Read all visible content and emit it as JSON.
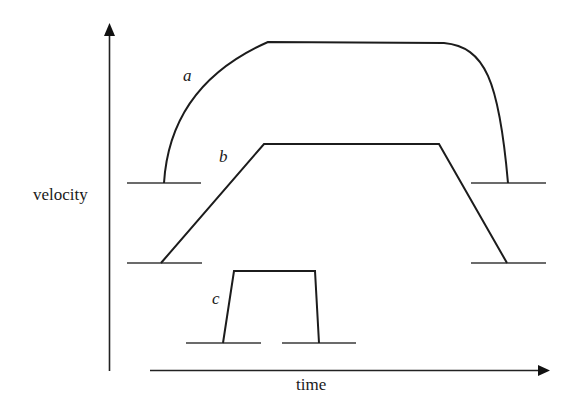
{
  "diagram": {
    "axes": {
      "y_label": "velocity",
      "x_label": "time"
    },
    "curves": [
      {
        "id": "a",
        "label": "a",
        "shape": "smooth rounded profile (gradual rise, long plateau, steep fall)"
      },
      {
        "id": "b",
        "label": "b",
        "shape": "trapezoidal profile (linear ramp up, plateau, linear ramp down)"
      },
      {
        "id": "c",
        "label": "c",
        "shape": "short near-rectangular pulse (steep ramps, short plateau)"
      }
    ],
    "colors": {
      "stroke": "#1c1c1c",
      "background": "#ffffff"
    }
  }
}
